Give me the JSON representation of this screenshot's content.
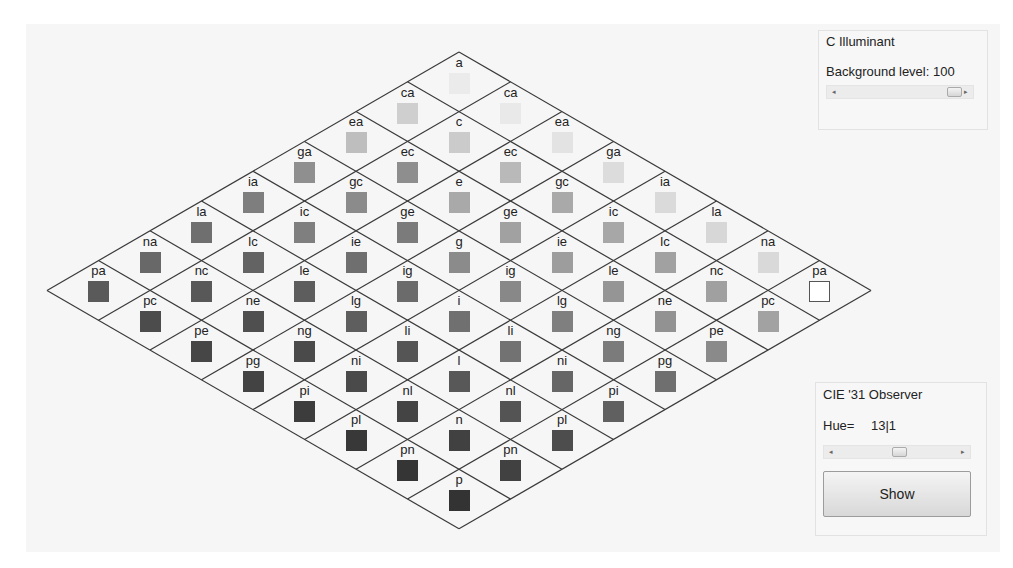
{
  "illuminant_panel": {
    "title": "C Illuminant",
    "background_label": "Background level: 100",
    "background_value": 100,
    "scroll_left_glyph": "◂",
    "scroll_right_glyph": "▸"
  },
  "observer_panel": {
    "title": "CIE '31 Observer",
    "hue_label": "Hue=",
    "hue_value": "13|1",
    "scroll_left_glyph": "◂",
    "scroll_right_glyph": "▸",
    "show_button": "Show"
  },
  "grid": {
    "letters": [
      "a",
      "c",
      "e",
      "g",
      "i",
      "l",
      "n",
      "p"
    ],
    "top_vertex": [
      433,
      28
    ],
    "step": [
      51.5,
      29.8
    ],
    "line_color": "#3a3a3a",
    "cells": [
      {
        "r": 0,
        "c": 0,
        "label": "a",
        "color": "#ebebeb"
      },
      {
        "r": 1,
        "c": 0,
        "label": "ca",
        "color": "#cfcfcf"
      },
      {
        "r": 0,
        "c": 1,
        "label": "ca",
        "color": "#e9e9e9"
      },
      {
        "r": 2,
        "c": 0,
        "label": "ea",
        "color": "#bebebe"
      },
      {
        "r": 1,
        "c": 1,
        "label": "c",
        "color": "#cbcbcb"
      },
      {
        "r": 0,
        "c": 2,
        "label": "ea",
        "color": "#e3e3e3"
      },
      {
        "r": 3,
        "c": 0,
        "label": "ga",
        "color": "#8f8f8f"
      },
      {
        "r": 2,
        "c": 1,
        "label": "ec",
        "color": "#8e8e8e"
      },
      {
        "r": 1,
        "c": 2,
        "label": "ec",
        "color": "#b9b9b9"
      },
      {
        "r": 0,
        "c": 3,
        "label": "ga",
        "color": "#dcdcdc"
      },
      {
        "r": 4,
        "c": 0,
        "label": "ia",
        "color": "#7e7e7e"
      },
      {
        "r": 3,
        "c": 1,
        "label": "gc",
        "color": "#8b8b8b"
      },
      {
        "r": 2,
        "c": 2,
        "label": "e",
        "color": "#a9a9a9"
      },
      {
        "r": 1,
        "c": 3,
        "label": "gc",
        "color": "#a9a9a9"
      },
      {
        "r": 0,
        "c": 4,
        "label": "ia",
        "color": "#dadada"
      },
      {
        "r": 5,
        "c": 0,
        "label": "la",
        "color": "#6f6f6f"
      },
      {
        "r": 4,
        "c": 1,
        "label": "ic",
        "color": "#7f7f7f"
      },
      {
        "r": 3,
        "c": 2,
        "label": "ge",
        "color": "#7b7b7b"
      },
      {
        "r": 2,
        "c": 3,
        "label": "ge",
        "color": "#a1a1a1"
      },
      {
        "r": 1,
        "c": 4,
        "label": "ic",
        "color": "#a7a7a7"
      },
      {
        "r": 0,
        "c": 5,
        "label": "la",
        "color": "#d7d7d7"
      },
      {
        "r": 6,
        "c": 0,
        "label": "na",
        "color": "#686868"
      },
      {
        "r": 5,
        "c": 1,
        "label": "lc",
        "color": "#636363"
      },
      {
        "r": 4,
        "c": 2,
        "label": "ie",
        "color": "#6f6f6f"
      },
      {
        "r": 3,
        "c": 3,
        "label": "g",
        "color": "#8b8b8b"
      },
      {
        "r": 2,
        "c": 4,
        "label": "ie",
        "color": "#9d9d9d"
      },
      {
        "r": 1,
        "c": 5,
        "label": "lc",
        "color": "#a1a1a1"
      },
      {
        "r": 0,
        "c": 6,
        "label": "na",
        "color": "#d9d9d9"
      },
      {
        "r": 7,
        "c": 0,
        "label": "pa",
        "color": "#5a5a5a"
      },
      {
        "r": 6,
        "c": 1,
        "label": "nc",
        "color": "#585858"
      },
      {
        "r": 5,
        "c": 2,
        "label": "le",
        "color": "#5d5d5d"
      },
      {
        "r": 4,
        "c": 3,
        "label": "ig",
        "color": "#6b6b6b"
      },
      {
        "r": 3,
        "c": 4,
        "label": "ig",
        "color": "#888888"
      },
      {
        "r": 2,
        "c": 5,
        "label": "le",
        "color": "#959595"
      },
      {
        "r": 1,
        "c": 6,
        "label": "nc",
        "color": "#a0a0a0"
      },
      {
        "r": 0,
        "c": 7,
        "label": "pa",
        "color": "#ffffff",
        "outline": true
      },
      {
        "r": 7,
        "c": 1,
        "label": "pc",
        "color": "#4c4c4c"
      },
      {
        "r": 6,
        "c": 2,
        "label": "ne",
        "color": "#4f4f4f"
      },
      {
        "r": 5,
        "c": 3,
        "label": "lg",
        "color": "#5e5e5e"
      },
      {
        "r": 4,
        "c": 4,
        "label": "i",
        "color": "#707070"
      },
      {
        "r": 3,
        "c": 5,
        "label": "lg",
        "color": "#7f7f7f"
      },
      {
        "r": 2,
        "c": 6,
        "label": "ne",
        "color": "#929292"
      },
      {
        "r": 1,
        "c": 7,
        "label": "pc",
        "color": "#a2a2a2"
      },
      {
        "r": 7,
        "c": 2,
        "label": "pe",
        "color": "#464646"
      },
      {
        "r": 6,
        "c": 3,
        "label": "ng",
        "color": "#4a4a4a"
      },
      {
        "r": 5,
        "c": 4,
        "label": "li",
        "color": "#555555"
      },
      {
        "r": 4,
        "c": 5,
        "label": "li",
        "color": "#727272"
      },
      {
        "r": 3,
        "c": 6,
        "label": "ng",
        "color": "#7b7b7b"
      },
      {
        "r": 2,
        "c": 7,
        "label": "pe",
        "color": "#8a8a8a"
      },
      {
        "r": 7,
        "c": 3,
        "label": "pg",
        "color": "#434343"
      },
      {
        "r": 6,
        "c": 4,
        "label": "ni",
        "color": "#4a4a4a"
      },
      {
        "r": 5,
        "c": 5,
        "label": "l",
        "color": "#585858"
      },
      {
        "r": 4,
        "c": 6,
        "label": "ni",
        "color": "#666666"
      },
      {
        "r": 3,
        "c": 7,
        "label": "pg",
        "color": "#6f6f6f"
      },
      {
        "r": 7,
        "c": 4,
        "label": "pi",
        "color": "#3c3c3c"
      },
      {
        "r": 6,
        "c": 5,
        "label": "nl",
        "color": "#444444"
      },
      {
        "r": 5,
        "c": 6,
        "label": "nl",
        "color": "#545454"
      },
      {
        "r": 4,
        "c": 7,
        "label": "pi",
        "color": "#606060"
      },
      {
        "r": 7,
        "c": 5,
        "label": "pl",
        "color": "#383838"
      },
      {
        "r": 6,
        "c": 6,
        "label": "n",
        "color": "#414141"
      },
      {
        "r": 5,
        "c": 7,
        "label": "pl",
        "color": "#4d4d4d"
      },
      {
        "r": 7,
        "c": 6,
        "label": "pn",
        "color": "#353535"
      },
      {
        "r": 6,
        "c": 7,
        "label": "pn",
        "color": "#414141"
      },
      {
        "r": 7,
        "c": 7,
        "label": "p",
        "color": "#333333"
      }
    ]
  }
}
